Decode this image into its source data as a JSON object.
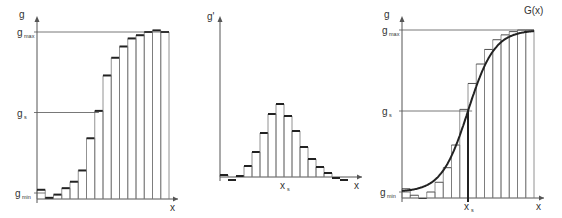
{
  "colors": {
    "axis": "#555555",
    "bar_edge": "#777777",
    "bar_top": "#222222",
    "curve": "#222222",
    "guide": "#555555"
  },
  "chart_data": [
    {
      "type": "bar",
      "title": "",
      "description": "Step histogram of g over x (cumulative sample values)",
      "ylabel": "g",
      "xlabel": "x",
      "y_levels": {
        "g_max": 1.0,
        "g_s": 0.5,
        "g_min": 0.0
      },
      "y_tick_labels": {
        "top": "g",
        "max": "g",
        "max_sub": "max",
        "s": "g",
        "s_sub": "s",
        "min": "g",
        "min_sub": "min"
      },
      "ylim": [
        -0.05,
        1.02
      ],
      "values": [
        0.02,
        -0.03,
        -0.01,
        0.03,
        0.07,
        0.14,
        0.34,
        0.51,
        0.73,
        0.84,
        0.91,
        0.96,
        0.98,
        1.0,
        1.01,
        1.0
      ]
    },
    {
      "type": "bar",
      "title": "",
      "description": "Derivative histogram g' with peak at x_s",
      "ylabel": "g'",
      "xlabel": "x",
      "x_marker_label": "x",
      "x_marker_sub": "s",
      "x_marker_index": 8,
      "ylim": [
        -0.05,
        1.0
      ],
      "values": [
        0.02,
        -0.03,
        0.01,
        0.11,
        0.25,
        0.44,
        0.63,
        0.73,
        0.61,
        0.46,
        0.3,
        0.18,
        0.1,
        0.04,
        -0.01,
        -0.03
      ]
    },
    {
      "type": "bar",
      "title": "",
      "description": "Histogram with fitted smooth curve G(x)",
      "ylabel": "g",
      "xlabel": "x",
      "curve_label": "G(x)",
      "x_marker_label": "x",
      "x_marker_sub": "s",
      "x_marker_index": 8,
      "y_levels": {
        "g_max": 1.0,
        "g_s": 0.5,
        "g_min": 0.0
      },
      "y_tick_labels": {
        "top": "g",
        "max": "g",
        "max_sub": "max",
        "s": "g",
        "s_sub": "s",
        "min": "g",
        "min_sub": "min"
      },
      "ylim": [
        -0.05,
        1.02
      ],
      "values": [
        0.02,
        -0.02,
        -0.04,
        0.0,
        0.06,
        0.15,
        0.29,
        0.51,
        0.67,
        0.79,
        0.88,
        0.94,
        0.97,
        0.99,
        1.0,
        1.0
      ]
    }
  ]
}
